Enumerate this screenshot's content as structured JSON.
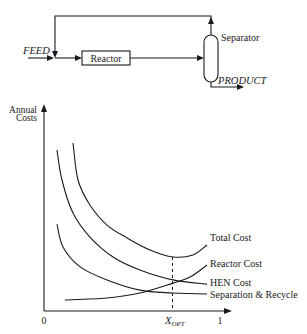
{
  "diagram": {
    "feed_label": "FEED",
    "reactor_label": "Reactor",
    "separator_label": "Separator",
    "product_label": "PRODUCT"
  },
  "chart": {
    "ylabel_line1": "Annual",
    "ylabel_line2": "Costs",
    "x_tick_0": "0",
    "x_tick_opt": "X",
    "x_tick_opt_sub": "OPT",
    "x_tick_1": "1"
  },
  "chart_data": {
    "type": "line",
    "title": "",
    "xlabel": "",
    "ylabel": "Annual Costs",
    "xlim": [
      0,
      1
    ],
    "ylim": [
      0,
      100
    ],
    "x_ticks": [
      "0",
      "X_OPT",
      "1"
    ],
    "x_opt": 0.73,
    "grid": false,
    "legend": "inline labels at right end of curves",
    "series": [
      {
        "name": "Total Cost",
        "x": [
          0.165,
          0.193,
          0.261,
          0.358,
          0.472,
          0.602,
          0.733,
          0.847,
          0.926
        ],
        "y": [
          81.2,
          63.3,
          51.2,
          41.5,
          35.3,
          29.5,
          26.1,
          27.1,
          31.9
        ]
      },
      {
        "name": "Reactor Cost",
        "x": [
          0.119,
          0.358,
          0.545,
          0.733,
          0.83,
          0.926
        ],
        "y": [
          5.3,
          6.3,
          8.7,
          13.5,
          16.4,
          22.2
        ]
      },
      {
        "name": "HEN Cost",
        "x": [
          0.074,
          0.102,
          0.165,
          0.261,
          0.392,
          0.545,
          0.733,
          0.926
        ],
        "y": [
          77.8,
          63.3,
          47.3,
          35.7,
          26.1,
          19.8,
          15.0,
          13.0
        ]
      },
      {
        "name": "Separation & Recycle",
        "x": [
          0.074,
          0.108,
          0.205,
          0.358,
          0.545,
          0.733,
          0.926
        ],
        "y": [
          42.0,
          30.9,
          21.3,
          15.0,
          10.1,
          8.7,
          8.2
        ]
      }
    ]
  }
}
